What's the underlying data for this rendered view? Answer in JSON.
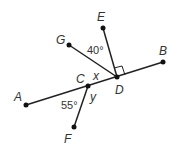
{
  "diagram": {
    "points": [
      {
        "id": "A",
        "label": "A",
        "x": 26,
        "y": 105,
        "lx": 14,
        "ly": 101
      },
      {
        "id": "B",
        "label": "B",
        "x": 163,
        "y": 62,
        "lx": 159,
        "ly": 55
      },
      {
        "id": "C",
        "label": "C",
        "x": 88,
        "y": 86,
        "lx": 76,
        "ly": 83
      },
      {
        "id": "D",
        "label": "D",
        "x": 117,
        "y": 77,
        "lx": 115,
        "ly": 94
      },
      {
        "id": "E",
        "label": "E",
        "x": 103,
        "y": 28,
        "lx": 97,
        "ly": 21
      },
      {
        "id": "G",
        "label": "G",
        "x": 69,
        "y": 45,
        "lx": 56,
        "ly": 44
      },
      {
        "id": "F",
        "label": "F",
        "x": 74,
        "y": 127,
        "lx": 64,
        "ly": 143
      }
    ],
    "segments": [
      [
        "A",
        "B"
      ],
      [
        "D",
        "E"
      ],
      [
        "D",
        "G"
      ],
      [
        "C",
        "F"
      ]
    ],
    "angle_labels": [
      {
        "text": "40°",
        "x": 87,
        "y": 54
      },
      {
        "text": "55°",
        "x": 61,
        "y": 109
      }
    ],
    "variables": [
      {
        "text": "x",
        "x": 93,
        "y": 80
      },
      {
        "text": "y",
        "x": 90,
        "y": 101
      }
    ],
    "right_angle_at": "D"
  }
}
